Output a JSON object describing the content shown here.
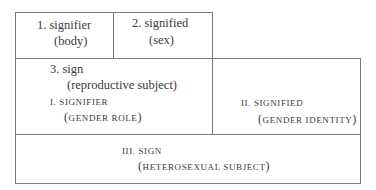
{
  "diagram": {
    "top_row": {
      "signifier": {
        "label": "1. signifier",
        "sub": "(body)"
      },
      "signified": {
        "label": "2. signified",
        "sub": "(sex)"
      }
    },
    "middle_row": {
      "sign": {
        "label": "3. sign",
        "sub": "(reproductive subject)"
      },
      "signifier": {
        "label": "I. signifier",
        "sub_inner": "gender role"
      },
      "signified": {
        "label": "II. signified",
        "sub_inner": "gender identity"
      }
    },
    "bottom_row": {
      "sign": {
        "label": "III. sign",
        "sub_inner": "heterosexual subject"
      }
    },
    "colors": {
      "border": "#7a7a7a",
      "text": "#3a3a3a",
      "background": "#ffffff"
    }
  }
}
